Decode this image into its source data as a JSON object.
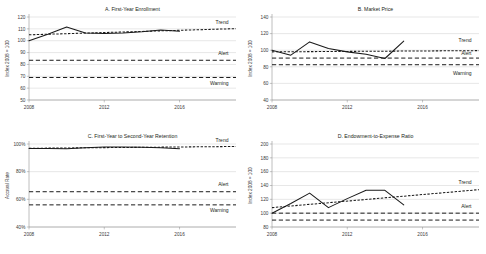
{
  "figure": {
    "background": "#ffffff",
    "ink_color": "#231f20",
    "grid_color": "#c9c9c9",
    "panel_order": [
      "A",
      "B",
      "C",
      "D"
    ]
  },
  "series_labels": {
    "trend": "Trend",
    "alert": "Alert",
    "warning": "Warning"
  },
  "chart_data": [
    {
      "id": "A",
      "type": "line",
      "title": "A. First-Year Enrollment",
      "xlabel": "",
      "ylabel": "Index 2008 = 100",
      "x": [
        2008,
        2009,
        2010,
        2011,
        2012,
        2013,
        2014,
        2015,
        2016
      ],
      "xlim": [
        2008,
        2019
      ],
      "ylim": [
        50,
        120
      ],
      "yticks": [
        50,
        60,
        70,
        80,
        90,
        100,
        110,
        120
      ],
      "yticklabels": [
        "50",
        "60",
        "70",
        "80",
        "90",
        "100",
        "110",
        "120"
      ],
      "xticks": [
        2008,
        2012,
        2016
      ],
      "xticklabels": [
        "2008",
        "2012",
        "2016"
      ],
      "grid": true,
      "legend_position": "inline-right",
      "series": [
        {
          "name": "Actual",
          "style": "solid",
          "x": [
            2008,
            2009,
            2010,
            2011,
            2012,
            2013,
            2014,
            2015,
            2016
          ],
          "values": [
            100.0,
            105.5,
            111.5,
            106.5,
            106.0,
            106.5,
            107.5,
            109.0,
            108.0
          ]
        },
        {
          "name": "Trend",
          "style": "dotted",
          "x": [
            2008,
            2019
          ],
          "values": [
            105.0,
            110.2
          ]
        },
        {
          "name": "Alert",
          "style": "dashed",
          "x": [
            2008,
            2019
          ],
          "values": [
            83.5,
            83.5
          ]
        },
        {
          "name": "Warning",
          "style": "dashed",
          "x": [
            2008,
            2019
          ],
          "values": [
            69.0,
            69.0
          ]
        }
      ],
      "annotations": [
        {
          "text": "Trend",
          "x": 2018.6,
          "y": 114.5
        },
        {
          "text": "Alert",
          "x": 2018.6,
          "y": 88.0
        },
        {
          "text": "Warning",
          "x": 2018.6,
          "y": 62.5
        }
      ]
    },
    {
      "id": "B",
      "type": "line",
      "title": "B. Market Price",
      "xlabel": "",
      "ylabel": "Index 2008 = 100",
      "x": [
        2008,
        2009,
        2010,
        2011,
        2012,
        2013,
        2014,
        2015
      ],
      "xlim": [
        2008,
        2019
      ],
      "ylim": [
        40,
        140
      ],
      "yticks": [
        40,
        60,
        80,
        100,
        120,
        140
      ],
      "yticklabels": [
        "40",
        "60",
        "80",
        "100",
        "120",
        "140"
      ],
      "xticks": [
        2008,
        2012,
        2016
      ],
      "xticklabels": [
        "2008",
        "2012",
        "2016"
      ],
      "grid": true,
      "legend_position": "inline-right",
      "series": [
        {
          "name": "Actual",
          "style": "solid",
          "x": [
            2008,
            2009,
            2010,
            2011,
            2012,
            2013,
            2014,
            2015
          ],
          "values": [
            100.0,
            94.0,
            110.0,
            102.0,
            98.0,
            95.0,
            90.0,
            111.0
          ]
        },
        {
          "name": "Trend",
          "style": "dotted",
          "x": [
            2008,
            2019
          ],
          "values": [
            98.0,
            99.5
          ]
        },
        {
          "name": "Alert",
          "style": "dashed",
          "x": [
            2008,
            2019
          ],
          "values": [
            90.5,
            90.5
          ]
        },
        {
          "name": "Warning",
          "style": "dashed",
          "x": [
            2008,
            2019
          ],
          "values": [
            82.5,
            82.5
          ]
        }
      ],
      "annotations": [
        {
          "text": "Trend",
          "x": 2018.6,
          "y": 110.0
        },
        {
          "text": "Alert",
          "x": 2018.6,
          "y": 94.5
        },
        {
          "text": "Warning",
          "x": 2018.6,
          "y": 70.0
        }
      ]
    },
    {
      "id": "C",
      "type": "line",
      "title": "C. First-Year to Second-Year Retention",
      "xlabel": "",
      "ylabel": "Accrual Rate",
      "x": [
        2008,
        2009,
        2010,
        2011,
        2012,
        2013,
        2014,
        2015,
        2016
      ],
      "xlim": [
        2008,
        2019
      ],
      "ylim": [
        40,
        100
      ],
      "yticks": [
        40,
        60,
        80,
        100
      ],
      "yticklabels": [
        "40%",
        "60%",
        "80%",
        "100%"
      ],
      "xticks": [
        2008,
        2012,
        2016
      ],
      "xticklabels": [
        "2008",
        "2012",
        "2016"
      ],
      "grid": true,
      "legend_position": "inline-right",
      "series": [
        {
          "name": "Actual",
          "style": "solid",
          "x": [
            2008,
            2009,
            2010,
            2011,
            2012,
            2013,
            2014,
            2015,
            2016
          ],
          "values": [
            96.8,
            96.8,
            96.6,
            97.3,
            97.8,
            97.8,
            97.6,
            97.3,
            96.5
          ]
        },
        {
          "name": "Trend",
          "style": "dotted",
          "x": [
            2008,
            2019
          ],
          "values": [
            96.9,
            98.2
          ]
        },
        {
          "name": "Alert",
          "style": "dashed",
          "x": [
            2008,
            2019
          ],
          "values": [
            65.5,
            65.5
          ]
        },
        {
          "name": "Warning",
          "style": "dashed",
          "x": [
            2008,
            2019
          ],
          "values": [
            56.0,
            56.0
          ]
        }
      ],
      "annotations": [
        {
          "text": "Trend",
          "x": 2018.6,
          "y": 101.5
        },
        {
          "text": "Alert",
          "x": 2018.6,
          "y": 69.5
        },
        {
          "text": "Warning",
          "x": 2018.6,
          "y": 50.5
        }
      ]
    },
    {
      "id": "D",
      "type": "line",
      "title": "D. Endowment-to-Expense Ratio",
      "xlabel": "",
      "ylabel": "Index 2008 = 100",
      "x": [
        2008,
        2009,
        2010,
        2011,
        2012,
        2013,
        2014,
        2015
      ],
      "xlim": [
        2008,
        2019
      ],
      "ylim": [
        80,
        200
      ],
      "yticks": [
        80,
        100,
        120,
        140,
        160,
        180,
        200
      ],
      "yticklabels": [
        "80",
        "100",
        "120",
        "140",
        "160",
        "180",
        "200"
      ],
      "xticks": [
        2008,
        2012,
        2016
      ],
      "xticklabels": [
        "2008",
        "2012",
        "2016"
      ],
      "grid": true,
      "legend_position": "inline-right",
      "series": [
        {
          "name": "Actual",
          "style": "solid",
          "x": [
            2008,
            2009,
            2010,
            2011,
            2012,
            2013,
            2014,
            2015
          ],
          "values": [
            100.0,
            114.0,
            129.0,
            108.0,
            121.0,
            133.0,
            133.0,
            112.0
          ]
        },
        {
          "name": "Trend",
          "style": "dotted",
          "x": [
            2008,
            2019
          ],
          "values": [
            108.0,
            134.0
          ]
        },
        {
          "name": "Alert",
          "style": "dashed",
          "x": [
            2008,
            2019
          ],
          "values": [
            100.0,
            100.0
          ]
        },
        {
          "name": "Warning",
          "style": "dashed",
          "x": [
            2008,
            2019
          ],
          "values": [
            90.0,
            90.0
          ]
        }
      ],
      "annotations": [
        {
          "text": "Trend",
          "x": 2018.6,
          "y": 142.0
        },
        {
          "text": "Alert",
          "x": 2018.6,
          "y": 108.0
        }
      ]
    }
  ]
}
